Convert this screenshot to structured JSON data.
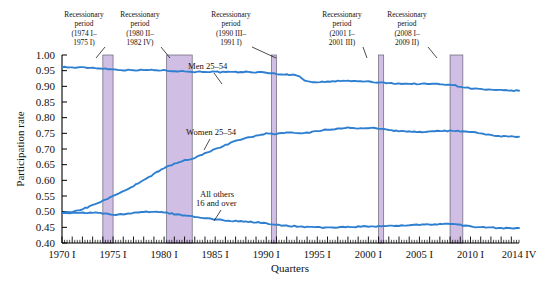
{
  "chart_data": {
    "type": "line",
    "title": "",
    "xlabel": "Quarters",
    "ylabel": "Participation rate",
    "ylim": [
      0.4,
      1.0
    ],
    "ytick_labels": [
      "0.40",
      "0.45",
      "0.50",
      "0.55",
      "0.60",
      "0.65",
      "0.70",
      "0.75",
      "0.80",
      "0.85",
      "0.90",
      "0.95",
      "1.00"
    ],
    "ytick_values": [
      0.4,
      0.45,
      0.5,
      0.55,
      0.6,
      0.65,
      0.7,
      0.75,
      0.8,
      0.85,
      0.9,
      0.95,
      1.0
    ],
    "xtick_labels": [
      "1970 I",
      "1975 I",
      "1980 I",
      "1985 I",
      "1990 I",
      "1995 I",
      "2000 I",
      "2005 I",
      "2010 I",
      "2014 IV"
    ],
    "xtick_values": [
      1970.0,
      1975.0,
      1980.0,
      1985.0,
      1990.0,
      1995.0,
      2000.0,
      2005.0,
      2010.0,
      2014.75
    ],
    "xlim": [
      1970.0,
      2014.75
    ],
    "grid": false,
    "legend_position": "inline-annotations",
    "series": [
      {
        "name": "Men 25–54",
        "color": "#2f7fd0",
        "x": [
          1970,
          1971,
          1972,
          1973,
          1974,
          1975,
          1976,
          1977,
          1978,
          1979,
          1980,
          1981,
          1982,
          1983,
          1984,
          1985,
          1986,
          1987,
          1988,
          1989,
          1990,
          1991,
          1992,
          1993,
          1994,
          1995,
          1996,
          1997,
          1998,
          1999,
          2000,
          2001,
          2002,
          2003,
          2004,
          2005,
          2006,
          2007,
          2008,
          2009,
          2010,
          2011,
          2012,
          2013,
          2014.75
        ],
        "values": [
          0.962,
          0.96,
          0.96,
          0.959,
          0.957,
          0.954,
          0.952,
          0.952,
          0.952,
          0.952,
          0.951,
          0.949,
          0.948,
          0.946,
          0.947,
          0.946,
          0.945,
          0.945,
          0.946,
          0.945,
          0.944,
          0.94,
          0.937,
          0.936,
          0.915,
          0.914,
          0.914,
          0.917,
          0.917,
          0.916,
          0.915,
          0.912,
          0.91,
          0.909,
          0.908,
          0.908,
          0.908,
          0.907,
          0.906,
          0.899,
          0.894,
          0.891,
          0.888,
          0.887,
          0.886
        ]
      },
      {
        "name": "Women 25–54",
        "color": "#2f7fd0",
        "x": [
          1970,
          1971,
          1972,
          1973,
          1974,
          1975,
          1976,
          1977,
          1978,
          1979,
          1980,
          1981,
          1982,
          1983,
          1984,
          1985,
          1986,
          1987,
          1988,
          1989,
          1990,
          1991,
          1992,
          1993,
          1994,
          1995,
          1996,
          1997,
          1998,
          1999,
          2000,
          2001,
          2002,
          2003,
          2004,
          2005,
          2006,
          2007,
          2008,
          2009,
          2010,
          2011,
          2012,
          2013,
          2014.75
        ],
        "values": [
          0.497,
          0.5,
          0.508,
          0.52,
          0.535,
          0.55,
          0.565,
          0.582,
          0.6,
          0.62,
          0.64,
          0.653,
          0.663,
          0.672,
          0.686,
          0.7,
          0.712,
          0.725,
          0.736,
          0.742,
          0.749,
          0.748,
          0.752,
          0.752,
          0.751,
          0.757,
          0.762,
          0.765,
          0.768,
          0.766,
          0.768,
          0.765,
          0.76,
          0.757,
          0.755,
          0.754,
          0.755,
          0.757,
          0.758,
          0.757,
          0.755,
          0.749,
          0.744,
          0.74,
          0.739
        ]
      },
      {
        "name": "All others 16 and over",
        "color": "#2f7fd0",
        "x": [
          1970,
          1971,
          1972,
          1973,
          1974,
          1975,
          1976,
          1977,
          1978,
          1979,
          1980,
          1981,
          1982,
          1983,
          1984,
          1985,
          1986,
          1987,
          1988,
          1989,
          1990,
          1991,
          1992,
          1993,
          1994,
          1995,
          1996,
          1997,
          1998,
          1999,
          2000,
          2001,
          2002,
          2003,
          2004,
          2005,
          2006,
          2007,
          2008,
          2009,
          2010,
          2011,
          2012,
          2013,
          2014.75
        ],
        "values": [
          0.497,
          0.496,
          0.497,
          0.497,
          0.494,
          0.489,
          0.492,
          0.495,
          0.5,
          0.5,
          0.498,
          0.492,
          0.488,
          0.483,
          0.479,
          0.475,
          0.472,
          0.47,
          0.468,
          0.466,
          0.463,
          0.458,
          0.455,
          0.453,
          0.451,
          0.45,
          0.449,
          0.45,
          0.451,
          0.452,
          0.453,
          0.453,
          0.454,
          0.456,
          0.457,
          0.458,
          0.459,
          0.46,
          0.461,
          0.458,
          0.453,
          0.45,
          0.449,
          0.447,
          0.448
        ]
      }
    ],
    "recession_bands": [
      {
        "label_line1": "Recessionary",
        "label_line2": "period",
        "label_line3": "(1974 I–",
        "label_line4": "1975 I)",
        "start": 1974.0,
        "end": 1975.0,
        "color": "#c9b3e0"
      },
      {
        "label_line1": "Recessionary",
        "label_line2": "period",
        "label_line3": "(1980 II–",
        "label_line4": "1982 IV)",
        "start": 1980.25,
        "end": 1982.75,
        "color": "#c9b3e0"
      },
      {
        "label_line1": "Recessionary",
        "label_line2": "period",
        "label_line3": "(1990 III–",
        "label_line4": "1991 I)",
        "start": 1990.5,
        "end": 1991.0,
        "color": "#c9b3e0"
      },
      {
        "label_line1": "Recessionary",
        "label_line2": "period",
        "label_line3": "(2001 I–",
        "label_line4": "2001 III)",
        "start": 2001.0,
        "end": 2001.5,
        "color": "#c9b3e0"
      },
      {
        "label_line1": "Recessionary",
        "label_line2": "period",
        "label_line3": "(2008 I–",
        "label_line4": "2009 II)",
        "start": 2008.0,
        "end": 2009.25,
        "color": "#c9b3e0"
      }
    ],
    "series_annotations": [
      {
        "text": "Men 25–54",
        "x": 188,
        "y": 69
      },
      {
        "text": "Women 25–54",
        "x": 186,
        "y": 135
      },
      {
        "text": "All others",
        "x": 200,
        "y": 197
      },
      {
        "text": "16 and over",
        "x": 196,
        "y": 206
      }
    ]
  },
  "colors": {
    "line": "#2f7fd0",
    "band_fill": "#c9b3e0",
    "band_stroke": "#4a4a5a",
    "axis": "#000000",
    "text": "#111111",
    "background": "#ffffff"
  }
}
